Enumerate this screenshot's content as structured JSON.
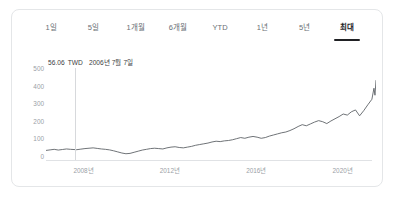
{
  "card": {
    "name": "stock-price-chart-card"
  },
  "range_tabs": {
    "items": [
      {
        "label": "1일",
        "active": false
      },
      {
        "label": "5일",
        "active": false
      },
      {
        "label": "1개월",
        "active": false
      },
      {
        "label": "6개월",
        "active": false
      },
      {
        "label": "YTD",
        "active": false
      },
      {
        "label": "1년",
        "active": false
      },
      {
        "label": "5년",
        "active": false
      },
      {
        "label": "최대",
        "active": true
      }
    ]
  },
  "readout": {
    "price": "56.06",
    "currency": "TWD",
    "date": "2006년 7월 7일",
    "full": "56.06 TWD   2006년 7월 7일"
  },
  "colors": {
    "line": "#5f6368",
    "axis_text": "#9aa0a6",
    "tab_text": "#6a6f75",
    "tab_active_text": "#1d1d1f",
    "underline": "#202124",
    "card_border": "#e4e6e8",
    "gridline": "#e0e2e5",
    "crosshair": "#d7d9dc",
    "background": "#ffffff"
  },
  "chart_data": {
    "type": "line",
    "title": "",
    "xlabel": "",
    "ylabel": "",
    "currency": "TWD",
    "grid": false,
    "legend": false,
    "ylim": [
      0,
      500
    ],
    "yticks": [
      500,
      400,
      300,
      200,
      100,
      0
    ],
    "xticks": [
      "2008년",
      "2012년",
      "2016년",
      "2020년"
    ],
    "xtick_positions_pct": [
      11.5,
      38.0,
      64.5,
      91.0
    ],
    "xlim": [
      "2005",
      "2021"
    ],
    "highlight_point": {
      "x": "2006년 7월 7일",
      "y": 56.06
    },
    "series": [
      {
        "name": "주가",
        "x": [
          2005.0,
          2005.2,
          2005.4,
          2005.6,
          2005.8,
          2006.0,
          2006.2,
          2006.5,
          2006.7,
          2006.9,
          2007.1,
          2007.3,
          2007.5,
          2007.7,
          2007.9,
          2008.1,
          2008.3,
          2008.5,
          2008.7,
          2008.9,
          2009.1,
          2009.3,
          2009.5,
          2009.7,
          2009.9,
          2010.1,
          2010.3,
          2010.5,
          2010.7,
          2010.9,
          2011.1,
          2011.3,
          2011.5,
          2011.7,
          2011.9,
          2012.1,
          2012.3,
          2012.5,
          2012.7,
          2012.9,
          2013.1,
          2013.3,
          2013.5,
          2013.7,
          2013.9,
          2014.1,
          2014.3,
          2014.5,
          2014.7,
          2014.9,
          2015.1,
          2015.3,
          2015.5,
          2015.7,
          2015.9,
          2016.1,
          2016.3,
          2016.5,
          2016.7,
          2016.9,
          2017.1,
          2017.3,
          2017.5,
          2017.7,
          2017.9,
          2018.1,
          2018.3,
          2018.5,
          2018.7,
          2018.9,
          2019.1,
          2019.3,
          2019.5,
          2019.7,
          2019.9,
          2020.1,
          2020.3,
          2020.5,
          2020.7,
          2020.9,
          2021.0,
          2021.05,
          2021.1
        ],
        "values": [
          52,
          55,
          58,
          54,
          57,
          60,
          58,
          56,
          59,
          62,
          64,
          66,
          63,
          60,
          58,
          55,
          50,
          44,
          38,
          34,
          36,
          42,
          48,
          54,
          58,
          62,
          64,
          62,
          60,
          66,
          70,
          72,
          68,
          66,
          70,
          74,
          80,
          84,
          88,
          92,
          98,
          102,
          100,
          104,
          106,
          110,
          116,
          122,
          118,
          124,
          128,
          124,
          118,
          122,
          130,
          136,
          142,
          148,
          152,
          160,
          170,
          182,
          192,
          186,
          196,
          206,
          214,
          208,
          198,
          212,
          224,
          236,
          250,
          244,
          262,
          272,
          240,
          268,
          300,
          330,
          390,
          352,
          432
        ]
      }
    ]
  }
}
